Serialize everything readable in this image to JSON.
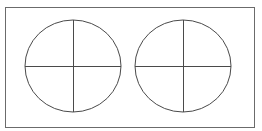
{
  "diagram": {
    "frame": {
      "x": 5,
      "y": 7,
      "width": 249,
      "height": 120,
      "stroke": "#6b6b6b"
    },
    "stroke_color": "#4a4a4a",
    "circles": [
      {
        "id": "left",
        "cx": 73,
        "cy": 66,
        "rx": 48,
        "ry": 46
      },
      {
        "id": "right",
        "cx": 183,
        "cy": 66,
        "rx": 48,
        "ry": 46
      }
    ]
  }
}
